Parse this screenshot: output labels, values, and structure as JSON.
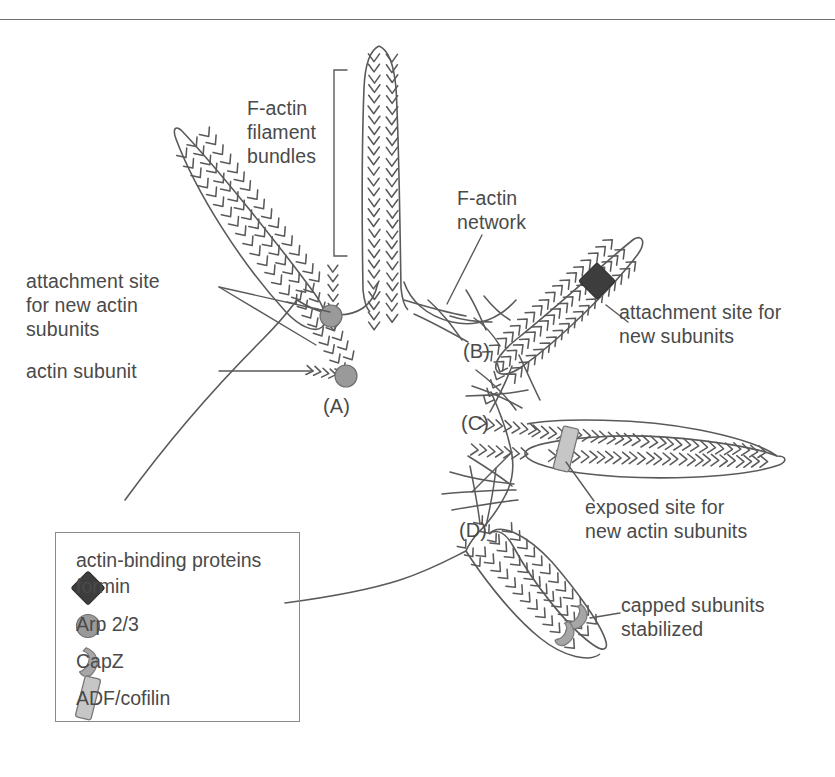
{
  "figure": {
    "domain": "diagram",
    "background_color": "#ffffff",
    "line_color": "#5a5a5a",
    "text_color": "#4a4a4a"
  },
  "labels": {
    "f_actin_bundles": "F-actin\nfilament\nbundles",
    "f_actin_network": "F-actin\nnetwork",
    "attachment_site_left": "attachment site\nfor new actin\nsubunits",
    "actin_subunit": "actin subunit",
    "attachment_site_right": "attachment site for\nnew subunits",
    "exposed_site": "exposed site for\nnew actin subunits",
    "capped_subunits": "capped subunits\nstabilized"
  },
  "markers": {
    "a": "(A)",
    "b": "(B)",
    "c": "(C)",
    "d": "(D)"
  },
  "legend": {
    "title": "actin-binding proteins",
    "items": [
      {
        "symbol": "diamond",
        "label": "formin",
        "color": "#3d3d3d"
      },
      {
        "symbol": "circle",
        "label": "Arp 2/3",
        "color": "#9a9a9a"
      },
      {
        "symbol": "hook",
        "label": "CapZ",
        "color": "#a6a6a6"
      },
      {
        "symbol": "rod",
        "label": "ADF/cofilin",
        "color": "#c6c6c6"
      }
    ]
  },
  "colors": {
    "formin": "#3d3d3d",
    "arp23": "#9a9a9a",
    "capz": "#a6a6a6",
    "adf_cofilin": "#c6c6c6",
    "outline": "#5a5a5a",
    "legend_border": "#8a8a8a",
    "rule": "#6e6e6e"
  }
}
